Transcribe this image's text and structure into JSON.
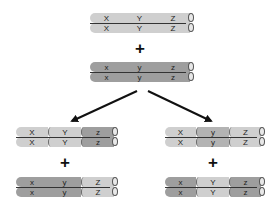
{
  "diagram": {
    "title": "",
    "colors": {
      "light": "#cfcfcf",
      "dark": "#9e9e9e",
      "mid": "#b3b3b3",
      "arrow": "#111111"
    },
    "parents": {
      "top": {
        "segments": [
          {
            "label": "X",
            "shade": "light"
          },
          {
            "label": "Y",
            "shade": "light"
          },
          {
            "label": "Z",
            "shade": "light"
          }
        ]
      },
      "plus": "+",
      "bottom": {
        "segments": [
          {
            "label": "x",
            "shade": "dark"
          },
          {
            "label": "y",
            "shade": "dark"
          },
          {
            "label": "z",
            "shade": "dark"
          }
        ]
      }
    },
    "outcomes": [
      {
        "top": {
          "segments": [
            {
              "label": "X",
              "shade": "light"
            },
            {
              "label": "Y",
              "shade": "light"
            },
            {
              "label": "z",
              "shade": "dark"
            }
          ]
        },
        "plus": "+",
        "bottom": {
          "segments": [
            {
              "label": "x",
              "shade": "dark"
            },
            {
              "label": "y",
              "shade": "dark"
            },
            {
              "label": "Z",
              "shade": "light"
            }
          ]
        }
      },
      {
        "top": {
          "segments": [
            {
              "label": "X",
              "shade": "light"
            },
            {
              "label": "y",
              "shade": "dark"
            },
            {
              "label": "Z",
              "shade": "light"
            }
          ]
        },
        "plus": "+",
        "bottom": {
          "segments": [
            {
              "label": "x",
              "shade": "dark"
            },
            {
              "label": "Y",
              "shade": "light"
            },
            {
              "label": "z",
              "shade": "dark"
            }
          ]
        }
      }
    ],
    "arrows": [
      {
        "from": [
          137,
          91
        ],
        "to": [
          70,
          122
        ],
        "label": ""
      },
      {
        "from": [
          148,
          91
        ],
        "to": [
          213,
          122
        ],
        "label": ""
      }
    ]
  }
}
